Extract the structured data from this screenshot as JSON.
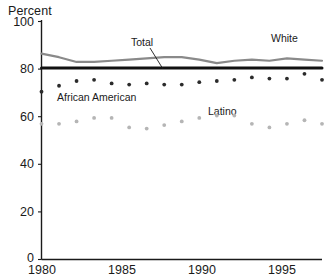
{
  "chart_data": {
    "type": "line",
    "title": "",
    "subtitle": "",
    "xlabel": "",
    "ylabel": "Percent",
    "xlim": [
      1980,
      1996
    ],
    "ylim": [
      0,
      100
    ],
    "grid": false,
    "legend_position": "inline-annotations",
    "xticks": [
      "1980",
      "1985",
      "1990",
      "1995"
    ],
    "xtick_values": [
      1980,
      1985,
      1990,
      1995
    ],
    "yticks": [
      "0",
      "20",
      "40",
      "60",
      "80",
      "100"
    ],
    "ytick_values": [
      0,
      20,
      40,
      60,
      80,
      100
    ],
    "x": [
      1980,
      1981,
      1982,
      1983,
      1984,
      1985,
      1986,
      1987,
      1988,
      1989,
      1990,
      1991,
      1992,
      1993,
      1994,
      1995,
      1996
    ],
    "series": [
      {
        "name": "White",
        "style": "line",
        "color": "#8a8a8a",
        "values": [
          86.5,
          85.0,
          83.0,
          83.0,
          83.5,
          84.0,
          84.5,
          85.0,
          85.0,
          84.0,
          82.5,
          83.5,
          84.0,
          83.5,
          84.5,
          84.0,
          83.5
        ]
      },
      {
        "name": "Total",
        "style": "line",
        "color": "#111111",
        "values": [
          80.5,
          80.5,
          80.5,
          80.5,
          80.5,
          80.5,
          80.5,
          80.5,
          80.5,
          80.5,
          80.5,
          80.5,
          80.5,
          80.5,
          80.5,
          80.5,
          80.5
        ]
      },
      {
        "name": "African American",
        "style": "dots",
        "color": "#2b2b2b",
        "values": [
          70.5,
          73.0,
          75.0,
          75.5,
          74.0,
          73.5,
          74.0,
          73.5,
          73.5,
          74.5,
          75.0,
          75.5,
          76.5,
          76.0,
          76.0,
          78.0,
          75.5
        ]
      },
      {
        "name": "Latino",
        "style": "dots",
        "color": "#b5b5b5",
        "values": [
          57.0,
          57.0,
          58.0,
          59.5,
          59.5,
          55.5,
          55.0,
          56.5,
          58.0,
          59.5,
          60.5,
          60.5,
          57.0,
          55.5,
          57.0,
          58.5,
          57.0
        ]
      }
    ],
    "annotations": [
      {
        "text": "Total",
        "x": 1987,
        "y": 91
      },
      {
        "text": "White",
        "x": 1994.6,
        "y": 92.5
      },
      {
        "text": "African American",
        "x": 1982.8,
        "y": 66.5
      },
      {
        "text": "Latino",
        "x": 1990.5,
        "y": 64.5
      }
    ]
  },
  "colors": {
    "axis": "#1a1a1a",
    "total_line": "#111111",
    "white_line": "#8a8a8a",
    "african_american_dots": "#2b2b2b",
    "latino_dots": "#b5b5b5",
    "background": "#ffffff"
  }
}
